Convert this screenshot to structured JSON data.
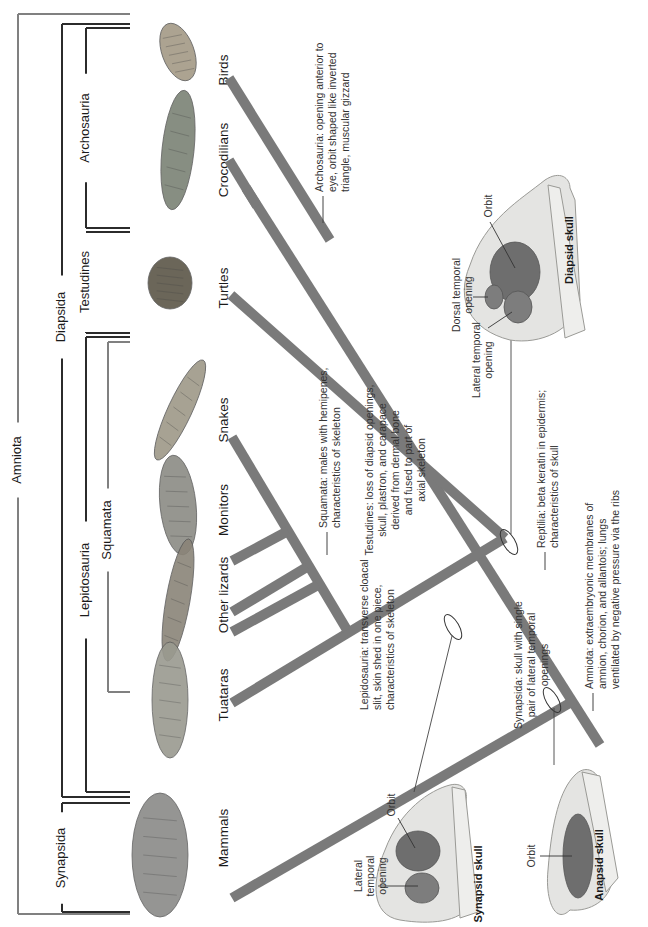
{
  "figure": {
    "orientation": "rotated-90-ccw",
    "colors": {
      "branch": "#7a7a7a",
      "bracket_dark": "#2b2b2b",
      "bracket_gray": "#808080",
      "leader": "#444444",
      "skull_fill": "#e4e4e2",
      "skull_stroke": "#9a9a96",
      "orbit_fill": "#6e6e6e",
      "opening_fill": "#7d7d7d"
    }
  },
  "clades": [
    {
      "id": "amniota",
      "label": "Amniota",
      "color": "gray",
      "x": 18,
      "y1": 14,
      "y2": 914,
      "label_y": 460,
      "ticks": [
        14,
        914
      ]
    },
    {
      "id": "synapsida",
      "label": "Synapsida",
      "color": "dark",
      "x": 62,
      "y1": 803,
      "y2": 912,
      "label_y": 858,
      "ticks": [
        803,
        912
      ]
    },
    {
      "id": "diapsida",
      "label": "Diapsida",
      "color": "dark",
      "x": 62,
      "y1": 24,
      "y2": 797,
      "label_y": 317,
      "ticks": [
        24,
        797
      ]
    },
    {
      "id": "archosauria",
      "label": "Archosauria",
      "color": "dark",
      "x": 86,
      "y1": 28,
      "y2": 228,
      "label_y": 128,
      "ticks": [
        28,
        228
      ]
    },
    {
      "id": "testudines",
      "label": "Testudines",
      "color": "dark",
      "x": 86,
      "y1": 232,
      "y2": 333,
      "label_y": 282,
      "ticks": [
        232,
        333
      ]
    },
    {
      "id": "lepidosauria",
      "label": "Lepidosauria",
      "color": "dark",
      "x": 86,
      "y1": 337,
      "y2": 792,
      "label_y": 580,
      "ticks": [
        337,
        792
      ]
    },
    {
      "id": "squamata",
      "label": "Squamata",
      "color": "gray",
      "x": 108,
      "y1": 342,
      "y2": 692,
      "label_y": 530,
      "ticks": [
        342,
        692
      ]
    }
  ],
  "taxa": [
    {
      "id": "birds",
      "label": "Birds",
      "x": 224,
      "y": 70,
      "icon": "bird-icon"
    },
    {
      "id": "crocodilians",
      "label": "Crocodilians",
      "x": 224,
      "y": 160,
      "icon": "crocodile-icon"
    },
    {
      "id": "turtles",
      "label": "Turtles",
      "x": 224,
      "y": 288,
      "icon": "turtle-icon"
    },
    {
      "id": "snakes",
      "label": "Snakes",
      "x": 224,
      "y": 420,
      "icon": "snake-icon"
    },
    {
      "id": "monitors",
      "label": "Monitors",
      "x": 224,
      "y": 510,
      "icon": "monitor-lizard-icon"
    },
    {
      "id": "other-lizards",
      "label": "Other lizards",
      "x": 224,
      "y": 595,
      "icon": "lizard-icon"
    },
    {
      "id": "tuataras",
      "label": "Tuataras",
      "x": 224,
      "y": 695,
      "icon": "tuatara-icon"
    },
    {
      "id": "mammals",
      "label": "Mammals",
      "x": 224,
      "y": 838,
      "icon": "mammal-icon"
    }
  ],
  "animals": [
    {
      "id": "bird",
      "name": "bird-icon",
      "cx": 178,
      "cy": 52,
      "rx": 16,
      "ry": 30,
      "rot": -20,
      "fill": "#a49a86"
    },
    {
      "id": "croc",
      "name": "crocodile-icon",
      "cx": 178,
      "cy": 150,
      "rx": 16,
      "ry": 60,
      "rot": 6,
      "fill": "#7b8275"
    },
    {
      "id": "turtle",
      "name": "turtle-icon",
      "cx": 170,
      "cy": 283,
      "rx": 22,
      "ry": 26,
      "rot": 0,
      "fill": "#5b5648"
    },
    {
      "id": "snake",
      "name": "snake-icon",
      "cx": 180,
      "cy": 410,
      "rx": 12,
      "ry": 55,
      "rot": 25,
      "fill": "#9e9888"
    },
    {
      "id": "monitor",
      "name": "monitor-lizard-icon",
      "cx": 178,
      "cy": 505,
      "rx": 18,
      "ry": 50,
      "rot": -6,
      "fill": "#8b8b84"
    },
    {
      "id": "lizard",
      "name": "lizard-icon",
      "cx": 178,
      "cy": 600,
      "rx": 12,
      "ry": 62,
      "rot": 10,
      "fill": "#8a8478"
    },
    {
      "id": "tuatara",
      "name": "tuatara-icon",
      "cx": 170,
      "cy": 700,
      "rx": 18,
      "ry": 58,
      "rot": 0,
      "fill": "#9a9a90"
    },
    {
      "id": "mammal",
      "name": "mammal-icon",
      "cx": 160,
      "cy": 855,
      "rx": 28,
      "ry": 62,
      "rot": 0,
      "fill": "#8a8a88"
    }
  ],
  "branches": [
    {
      "id": "main-trunk",
      "x1": 600,
      "y1": 745,
      "x2": 246,
      "y2": 188,
      "w": 10
    },
    {
      "id": "birds-stem",
      "x1": 246,
      "y1": 188,
      "x2": 229,
      "y2": 78,
      "w": 0
    },
    {
      "id": "croc-branch",
      "x1": 229,
      "y1": 160,
      "x2": 257,
      "y2": 206,
      "w": 10
    },
    {
      "id": "croc-bar",
      "x1": 245,
      "y1": 185,
      "x2": 278,
      "y2": 165,
      "w": 0
    },
    {
      "id": "birds-branch",
      "x1": 229,
      "y1": 78,
      "x2": 330,
      "y2": 240,
      "w": 10
    },
    {
      "id": "turtle-branch",
      "x1": 231,
      "y1": 295,
      "x2": 505,
      "y2": 538,
      "w": 10
    },
    {
      "id": "lepido-branch",
      "x1": 505,
      "y1": 538,
      "x2": 232,
      "y2": 703,
      "w": 10
    },
    {
      "id": "squamata-branch",
      "x1": 347,
      "y1": 630,
      "x2": 232,
      "y2": 437,
      "w": 10
    },
    {
      "id": "monitor-branch",
      "x1": 288,
      "y1": 531,
      "x2": 232,
      "y2": 561,
      "w": 10
    },
    {
      "id": "lizard-branch-1",
      "x1": 307,
      "y1": 567,
      "x2": 232,
      "y2": 612,
      "w": 10
    },
    {
      "id": "lizard-branch-2",
      "x1": 318,
      "y1": 585,
      "x2": 232,
      "y2": 632,
      "w": 10
    },
    {
      "id": "mammal-branch",
      "x1": 575,
      "y1": 700,
      "x2": 232,
      "y2": 898,
      "w": 10
    }
  ],
  "nodes": [
    {
      "id": "synapsida-node",
      "cx": 453,
      "cy": 627,
      "rx": 6,
      "ry": 14,
      "rot": -30
    },
    {
      "id": "amniota-node",
      "cx": 552,
      "cy": 700,
      "rx": 6,
      "ry": 14,
      "rot": -30
    },
    {
      "id": "reptilia-node",
      "cx": 509,
      "cy": 542,
      "rx": 6,
      "ry": 14,
      "rot": -30
    }
  ],
  "annotations": [
    {
      "id": "archosauria-note",
      "lead": [
        [
          323,
          223
        ],
        [
          323,
          196
        ]
      ],
      "x": 323,
      "y": 192,
      "anchor": "start",
      "lines": [
        "Archosauria: opening anterior to",
        "eye, orbit shaped like inverted",
        "triangle, muscular gizzard"
      ]
    },
    {
      "id": "squamata-note",
      "lead": [
        [
          327,
          555
        ],
        [
          327,
          532
        ]
      ],
      "x": 327,
      "y": 528,
      "anchor": "start",
      "lines": [
        "Squamata: males with hemipenes,",
        "characteristics of skeleton"
      ]
    },
    {
      "id": "lepidosauria-note",
      "lead": [],
      "x": 368,
      "y": 710,
      "anchor": "start",
      "lines": [
        "Lepidosauria: transverse cloacal",
        "slit, skin shed in one piece,",
        "characteristics of skeleton"
      ]
    },
    {
      "id": "testudines-note",
      "lead": [],
      "x": 373,
      "y": 470,
      "anchor": "middle",
      "lines": [
        "Testudines: loss of diapsid openings,",
        "skull, plastron, and carapace",
        "derived from dermal bone",
        "and fused to part of",
        "axial skeleton"
      ]
    },
    {
      "id": "synapsida-note",
      "lead": [],
      "x": 522,
      "y": 665,
      "anchor": "middle",
      "lines": [
        "Synapsida: skull with single",
        "pair of lateral temporal",
        "openings"
      ]
    },
    {
      "id": "reptilia-note",
      "lead": [
        [
          545,
          570
        ],
        [
          545,
          552
        ]
      ],
      "x": 545,
      "y": 548,
      "anchor": "start",
      "lines": [
        "Reptilia: beta keratin in epidermis;",
        "characteristics of skull"
      ]
    },
    {
      "id": "amniota-note",
      "lead": [
        [
          593,
          711
        ],
        [
          593,
          693
        ]
      ],
      "x": 593,
      "y": 689,
      "anchor": "start",
      "lines": [
        "Amniota: extraembryonic membranes of",
        "amnion, chorion, and allantois; lungs",
        "ventilated by negative pressure via the ribs"
      ]
    }
  ],
  "leader_lines": [
    {
      "id": "synapsid-node-leader",
      "x1": 452,
      "y1": 636,
      "x2": 414,
      "y2": 792
    },
    {
      "id": "amniota-node-leader",
      "x1": 554,
      "y1": 708,
      "x2": 554,
      "y2": 765
    },
    {
      "id": "reptilia-node-leader",
      "x1": 511,
      "y1": 534,
      "x2": 511,
      "y2": 335
    }
  ],
  "skulls": [
    {
      "id": "diapsid",
      "title": "Diapsid skull",
      "title_x": 573,
      "title_y": 250,
      "path": "M 510 340 C 470 330 455 300 470 265 C 485 220 520 200 545 180 C 560 170 570 178 570 188 L 575 200 L 580 300 C 575 330 540 345 510 340 Z",
      "jaw": "M 548 185 L 560 188 L 585 330 L 565 338 Z",
      "orbit": {
        "cx": 515,
        "cy": 272,
        "rx": 25,
        "ry": 30
      },
      "openings": [
        {
          "id": "dorsal-temporal",
          "cx": 494,
          "cy": 297,
          "rx": 9,
          "ry": 12
        },
        {
          "id": "lateral-temporal",
          "cx": 518,
          "cy": 307,
          "rx": 14,
          "ry": 16
        }
      ],
      "parts": [
        {
          "id": "orbit-label",
          "lines": [
            "Orbit"
          ],
          "x": 492,
          "y": 206,
          "lead": [
            [
              490,
              222
            ],
            [
              515,
              268
            ]
          ]
        },
        {
          "id": "dorsal-temporal-label",
          "lines": [
            "Dorsal temporal",
            "opening"
          ],
          "x": 460,
          "y": 295,
          "lead": [
            [
              473,
              297
            ],
            [
              488,
              297
            ]
          ]
        },
        {
          "id": "lateral-temporal-label",
          "lines": [
            "Lateral temporal",
            "opening"
          ],
          "x": 480,
          "y": 360,
          "lead": [
            [
              488,
              328
            ],
            [
              512,
              312
            ]
          ]
        }
      ]
    },
    {
      "id": "synapsid",
      "title": "Synapsid skull",
      "title_x": 482,
      "title_y": 884,
      "path": "M 400 920 C 370 915 372 880 385 850 C 400 810 430 790 450 785 C 462 782 468 790 466 800 L 470 905 C 460 922 430 925 400 920 Z",
      "jaw": "M 452 787 L 465 790 L 478 912 L 460 918 Z",
      "orbit": {
        "cx": 418,
        "cy": 851,
        "rx": 22,
        "ry": 20
      },
      "openings": [
        {
          "id": "lateral-temporal",
          "cx": 422,
          "cy": 888,
          "rx": 17,
          "ry": 15
        }
      ],
      "parts": [
        {
          "id": "orbit-label",
          "lines": [
            "Orbit"
          ],
          "x": 395,
          "y": 805,
          "lead": [
            [
              398,
              818
            ],
            [
              415,
              848
            ]
          ]
        },
        {
          "id": "lateral-temporal-label",
          "lines": [
            "Lateral",
            "temporal",
            "opening"
          ],
          "x": 362,
          "y": 876,
          "lead": [
            [
              378,
              886
            ],
            [
              418,
              886
            ]
          ]
        }
      ]
    },
    {
      "id": "anapsid",
      "title": "Anapsid skull",
      "title_x": 603,
      "title_y": 865,
      "path": "M 570 910 C 555 925 545 900 548 870 C 552 820 560 790 575 775 C 585 765 595 770 600 780 L 612 880 C 610 900 590 912 570 910 Z",
      "jaw": "M 582 772 L 600 776 L 618 878 L 606 892 Z",
      "orbit": {
        "cx": 578,
        "cy": 856,
        "rx": 15,
        "ry": 42
      },
      "openings": [],
      "parts": [
        {
          "id": "orbit-label",
          "lines": [
            "Orbit"
          ],
          "x": 535,
          "y": 856,
          "lead": [
            [
              540,
              856
            ],
            [
              572,
              856
            ]
          ]
        }
      ]
    }
  ]
}
